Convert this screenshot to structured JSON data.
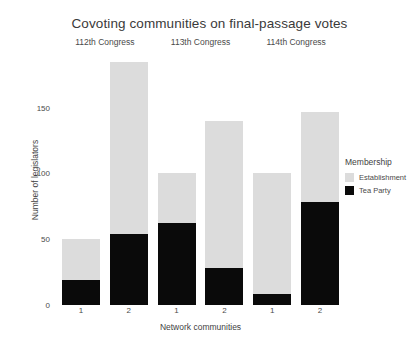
{
  "chart_data": {
    "type": "bar",
    "title": "Covoting communities on final-passage votes",
    "xlabel": "Network communities",
    "ylabel": "Number of legislators",
    "ylim": [
      0,
      190
    ],
    "yticks": [
      0,
      50,
      100,
      150
    ],
    "ytick_labels": [
      "0",
      "50",
      "100",
      "150"
    ],
    "grid": false,
    "stacked": true,
    "legend": {
      "title": "Membership",
      "position": "right",
      "entries": [
        {
          "name": "Establishment",
          "color": "#dcdcdc"
        },
        {
          "name": "Tea Party",
          "color": "#0a0a0a"
        }
      ]
    },
    "facet_variable": "Congress",
    "facets": [
      {
        "label": "112th Congress",
        "categories": [
          "1",
          "2"
        ],
        "series": [
          {
            "name": "Establishment",
            "values": [
              31,
              131
            ]
          },
          {
            "name": "Tea Party",
            "values": [
              19,
              54
            ]
          }
        ],
        "totals": [
          50,
          185
        ]
      },
      {
        "label": "113th Congress",
        "categories": [
          "1",
          "2"
        ],
        "series": [
          {
            "name": "Establishment",
            "values": [
              38,
              112
            ]
          },
          {
            "name": "Tea Party",
            "values": [
              62,
              28
            ]
          }
        ],
        "totals": [
          100,
          140
        ]
      },
      {
        "label": "114th Congress",
        "categories": [
          "1",
          "2"
        ],
        "series": [
          {
            "name": "Establishment",
            "values": [
              92,
              69
            ]
          },
          {
            "name": "Tea Party",
            "values": [
              8,
              78
            ]
          }
        ],
        "totals": [
          100,
          147
        ]
      }
    ]
  }
}
